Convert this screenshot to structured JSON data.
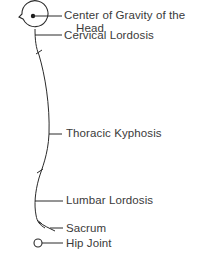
{
  "diagram": {
    "type": "spinal-alignment-sagittal",
    "colors": {
      "line": "#2a2a2a",
      "text": "#3a3a3a",
      "background": "#ffffff"
    },
    "labels": {
      "head_gravity_line1": "Center of Gravity of the",
      "head_gravity_line2": "Head",
      "cervical": "Cervical Lordosis",
      "thoracic": "Thoracic Kyphosis",
      "lumbar": "Lumbar Lordosis",
      "sacrum": "Sacrum",
      "hip": "Hip Joint"
    }
  }
}
